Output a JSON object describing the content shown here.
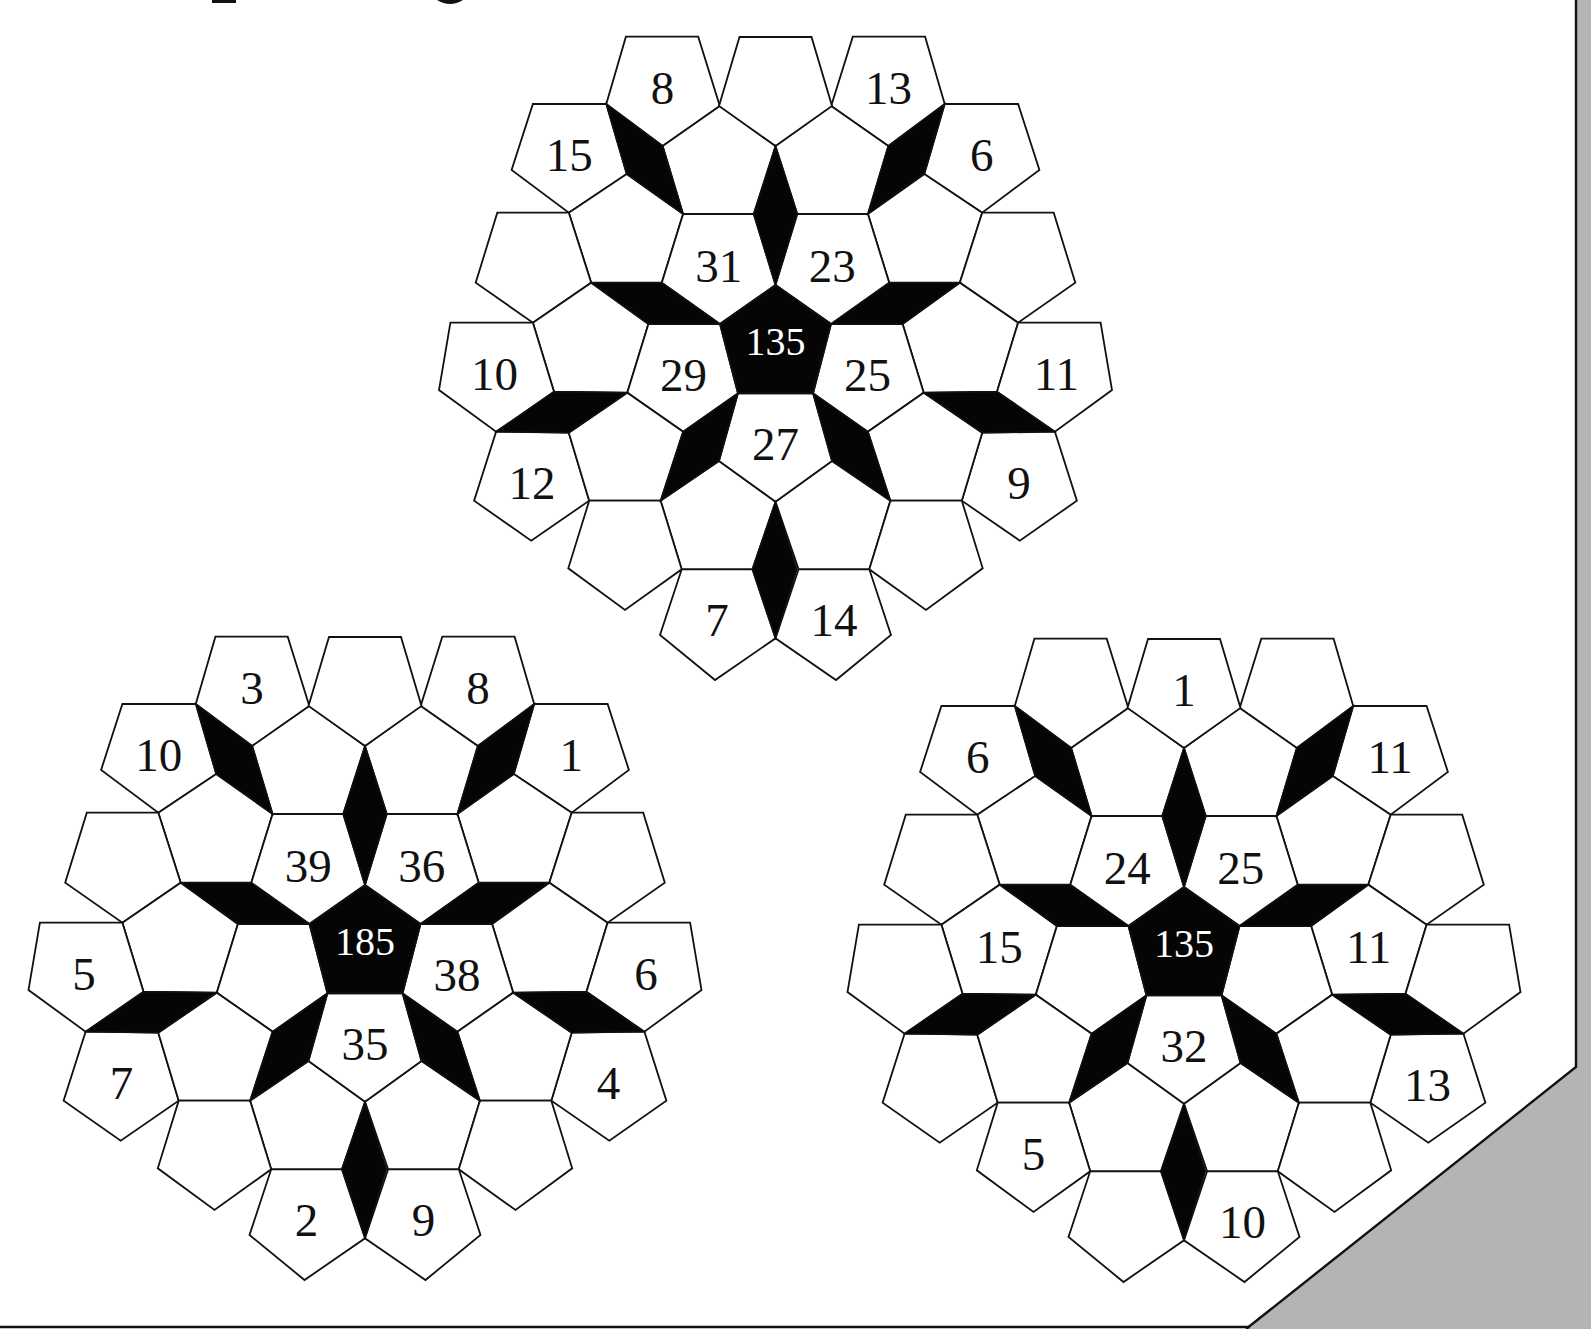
{
  "page": {
    "title_fragment": "",
    "colors": {
      "background": "#ffffff",
      "tile_fill": "#ffffff",
      "tile_stroke": "#111111",
      "dark_fill": "#050505",
      "center_text": "#ffffff",
      "label_text": "#111111",
      "page_curl_gray": "#b4b4b4"
    }
  },
  "puzzles": [
    {
      "name": "top-puzzle",
      "offset": [
        0,
        0
      ],
      "center_label": "135",
      "labels": {
        "top_l": "8",
        "top_r": "13",
        "upper_l": "15",
        "upper_r": "6",
        "i_ul": "31",
        "i_ur": "23",
        "i_l": "29",
        "i_r": "25",
        "i_b": "27",
        "out_l": "10",
        "out_r": "11",
        "low_out_l": "12",
        "low_out_r": "9",
        "bot_l": "7",
        "bot_r": "14"
      }
    },
    {
      "name": "bottom-left-puzzle",
      "offset": [
        -410.5,
        600
      ],
      "center_label": "185",
      "labels": {
        "top_l": "3",
        "top_r": "8",
        "upper_l": "10",
        "upper_r": "1",
        "i_ul": "39",
        "i_ur": "36",
        "i_r": "38",
        "i_b": "35",
        "out_l": "5",
        "out_r": "6",
        "low_out_l": "7",
        "low_out_r": "4",
        "bot_l": "2",
        "bot_r": "9"
      }
    },
    {
      "name": "bottom-right-puzzle",
      "offset": [
        408.5,
        602
      ],
      "center_label": "135",
      "labels": {
        "top_m": "1",
        "upper_l": "6",
        "upper_r": "11",
        "i_ul": "24",
        "i_ur": "25",
        "mid_l": "15",
        "mid_r": "11",
        "i_b": "32",
        "low_out_r": "13",
        "outlow_l": "5",
        "bot_r": "10"
      }
    }
  ]
}
